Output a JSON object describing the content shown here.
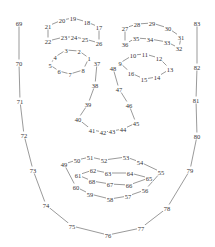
{
  "diagram": {
    "type": "facial-landmarks",
    "width": 215,
    "height": 247,
    "colors": {
      "line": "#555555",
      "text": "#333333",
      "background": "#ffffff"
    },
    "points": {
      "1": [
        89,
        58
      ],
      "2": [
        79,
        51
      ],
      "3": [
        66,
        50
      ],
      "4": [
        55,
        57
      ],
      "5": [
        50,
        65
      ],
      "6": [
        59,
        71
      ],
      "7": [
        70,
        74
      ],
      "8": [
        83,
        70
      ],
      "9": [
        120,
        63
      ],
      "10": [
        133,
        55
      ],
      "11": [
        145,
        54
      ],
      "12": [
        159,
        58
      ],
      "13": [
        170,
        69
      ],
      "14": [
        157,
        77
      ],
      "15": [
        144,
        79
      ],
      "16": [
        131,
        73
      ],
      "17": [
        99,
        27
      ],
      "18": [
        87,
        22
      ],
      "19": [
        73,
        18
      ],
      "20": [
        62,
        20
      ],
      "21": [
        48,
        26
      ],
      "22": [
        48,
        41
      ],
      "23": [
        64,
        37
      ],
      "24": [
        74,
        37
      ],
      "25": [
        85,
        39
      ],
      "26": [
        99,
        43
      ],
      "27": [
        125,
        28
      ],
      "28": [
        137,
        24
      ],
      "29": [
        152,
        23
      ],
      "30": [
        168,
        28
      ],
      "31": [
        181,
        37
      ],
      "32": [
        179,
        48
      ],
      "33": [
        167,
        42
      ],
      "34": [
        150,
        39
      ],
      "35": [
        136,
        38
      ],
      "36": [
        125,
        44
      ],
      "37": [
        97,
        63
      ],
      "38": [
        95,
        85
      ],
      "39": [
        88,
        104
      ],
      "40": [
        78,
        119
      ],
      "41": [
        92,
        130
      ],
      "42": [
        103,
        132
      ],
      "43": [
        112,
        131
      ],
      "44": [
        123,
        129
      ],
      "45": [
        136,
        123
      ],
      "46": [
        129,
        105
      ],
      "47": [
        119,
        89
      ],
      "48": [
        113,
        68
      ],
      "49": [
        64,
        164
      ],
      "50": [
        77,
        160
      ],
      "51": [
        90,
        157
      ],
      "52": [
        104,
        160
      ],
      "53": [
        126,
        157
      ],
      "54": [
        140,
        162
      ],
      "55": [
        161,
        172
      ],
      "56": [
        145,
        190
      ],
      "57": [
        128,
        196
      ],
      "58": [
        110,
        199
      ],
      "59": [
        90,
        194
      ],
      "60": [
        76,
        187
      ],
      "61": [
        78,
        175
      ],
      "62": [
        93,
        170
      ],
      "63": [
        108,
        173
      ],
      "64": [
        130,
        173
      ],
      "65": [
        149,
        178
      ],
      "66": [
        129,
        185
      ],
      "67": [
        110,
        184
      ],
      "68": [
        92,
        181
      ],
      "69": [
        19,
        23
      ],
      "70": [
        19,
        63
      ],
      "71": [
        20,
        101
      ],
      "72": [
        24,
        135
      ],
      "73": [
        33,
        170
      ],
      "74": [
        46,
        205
      ],
      "75": [
        72,
        226
      ],
      "76": [
        108,
        235
      ],
      "77": [
        141,
        228
      ],
      "78": [
        167,
        208
      ],
      "79": [
        190,
        170
      ],
      "80": [
        197,
        136
      ],
      "81": [
        196,
        100
      ],
      "82": [
        197,
        67
      ],
      "83": [
        197,
        23
      ]
    },
    "groups": [
      {
        "name": "left-eyebrow",
        "closed": true,
        "order": [
          "21",
          "20",
          "19",
          "18",
          "17",
          "26",
          "25",
          "24",
          "23",
          "22"
        ]
      },
      {
        "name": "right-eyebrow",
        "closed": true,
        "order": [
          "27",
          "28",
          "29",
          "30",
          "31",
          "32",
          "33",
          "34",
          "35",
          "36"
        ]
      },
      {
        "name": "left-eye",
        "closed": true,
        "order": [
          "1",
          "2",
          "3",
          "4",
          "5",
          "6",
          "7",
          "8"
        ]
      },
      {
        "name": "right-eye",
        "closed": true,
        "order": [
          "9",
          "10",
          "11",
          "12",
          "13",
          "14",
          "15",
          "16"
        ]
      },
      {
        "name": "nose",
        "closed": false,
        "order": [
          "37",
          "38",
          "39",
          "40",
          "41",
          "42",
          "43",
          "44",
          "45",
          "46",
          "47",
          "48"
        ]
      },
      {
        "name": "outer-lip",
        "closed": true,
        "order": [
          "49",
          "50",
          "51",
          "52",
          "53",
          "54",
          "55",
          "56",
          "57",
          "58",
          "59",
          "60"
        ]
      },
      {
        "name": "inner-lip",
        "closed": true,
        "order": [
          "61",
          "62",
          "63",
          "64",
          "65",
          "66",
          "67",
          "68"
        ]
      },
      {
        "name": "face-contour",
        "closed": false,
        "order": [
          "69",
          "70",
          "71",
          "72",
          "73",
          "74",
          "75",
          "76",
          "77",
          "78",
          "79",
          "80",
          "81",
          "82",
          "83"
        ]
      }
    ]
  }
}
